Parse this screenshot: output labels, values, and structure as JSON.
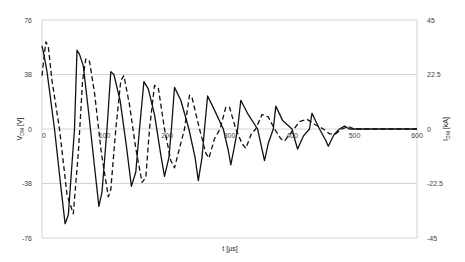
{
  "chart_data": {
    "type": "line",
    "title": "",
    "xlabel": "t [µs]",
    "ylabel": "V_DM [V]",
    "y2label": "I_DM [kA]",
    "xlim": [
      0,
      600
    ],
    "ylim": [
      -76,
      76
    ],
    "y2lim": [
      -45,
      45
    ],
    "grid": "horizontal",
    "legend": "none",
    "x_ticks": [
      "0",
      "100",
      "200",
      "300",
      "400",
      "500",
      "600"
    ],
    "y_ticks": [
      "76",
      "38",
      "0",
      "-38",
      "-76"
    ],
    "y2_ticks": [
      "45",
      "22.5",
      "0",
      "-22.5",
      "-45"
    ],
    "series": [
      {
        "name": "V_DM (solid)",
        "axis": "left",
        "style": "solid",
        "points": [
          [
            0,
            58
          ],
          [
            3,
            52
          ],
          [
            8,
            40
          ],
          [
            20,
            0
          ],
          [
            30,
            -40
          ],
          [
            37,
            -66
          ],
          [
            42,
            -60
          ],
          [
            52,
            0
          ],
          [
            56,
            55
          ],
          [
            60,
            52
          ],
          [
            66,
            44
          ],
          [
            75,
            10
          ],
          [
            85,
            -30
          ],
          [
            91,
            -54
          ],
          [
            96,
            -44
          ],
          [
            104,
            0
          ],
          [
            110,
            40
          ],
          [
            115,
            38
          ],
          [
            125,
            20
          ],
          [
            135,
            -12
          ],
          [
            143,
            -40
          ],
          [
            150,
            -30
          ],
          [
            156,
            0
          ],
          [
            163,
            33
          ],
          [
            170,
            28
          ],
          [
            180,
            10
          ],
          [
            190,
            -18
          ],
          [
            196,
            -33
          ],
          [
            203,
            -20
          ],
          [
            207,
            0
          ],
          [
            212,
            29
          ],
          [
            222,
            20
          ],
          [
            235,
            0
          ],
          [
            245,
            -20
          ],
          [
            250,
            -36
          ],
          [
            256,
            -20
          ],
          [
            260,
            0
          ],
          [
            265,
            23
          ],
          [
            275,
            14
          ],
          [
            290,
            0
          ],
          [
            298,
            -15
          ],
          [
            302,
            -25
          ],
          [
            308,
            -12
          ],
          [
            313,
            0
          ],
          [
            318,
            20
          ],
          [
            330,
            10
          ],
          [
            345,
            0
          ],
          [
            352,
            -14
          ],
          [
            356,
            -22
          ],
          [
            362,
            -10
          ],
          [
            370,
            0
          ],
          [
            374,
            16
          ],
          [
            385,
            6
          ],
          [
            400,
            0
          ],
          [
            405,
            -8
          ],
          [
            409,
            -14
          ],
          [
            418,
            -5
          ],
          [
            428,
            0
          ],
          [
            432,
            11
          ],
          [
            444,
            0
          ],
          [
            454,
            -8
          ],
          [
            458,
            -12
          ],
          [
            467,
            -4
          ],
          [
            476,
            0
          ],
          [
            484,
            2
          ],
          [
            492,
            0
          ],
          [
            500,
            0
          ],
          [
            600,
            0
          ]
        ]
      },
      {
        "name": "I_DM (dashed)",
        "axis": "right",
        "style": "dashed",
        "points": [
          [
            0,
            22
          ],
          [
            6,
            36
          ],
          [
            10,
            34
          ],
          [
            16,
            20
          ],
          [
            28,
            0
          ],
          [
            40,
            -27
          ],
          [
            50,
            -35
          ],
          [
            58,
            -10
          ],
          [
            65,
            20
          ],
          [
            70,
            29
          ],
          [
            76,
            28
          ],
          [
            84,
            15
          ],
          [
            95,
            -10
          ],
          [
            106,
            -28
          ],
          [
            110,
            -25
          ],
          [
            118,
            0
          ],
          [
            126,
            20
          ],
          [
            131,
            22
          ],
          [
            140,
            10
          ],
          [
            150,
            -8
          ],
          [
            160,
            -22
          ],
          [
            166,
            -20
          ],
          [
            172,
            0
          ],
          [
            180,
            18
          ],
          [
            186,
            17
          ],
          [
            196,
            0
          ],
          [
            206,
            -13
          ],
          [
            212,
            -16
          ],
          [
            220,
            -8
          ],
          [
            228,
            0
          ],
          [
            236,
            14
          ],
          [
            240,
            13
          ],
          [
            252,
            0
          ],
          [
            262,
            -10
          ],
          [
            267,
            -12
          ],
          [
            276,
            -4
          ],
          [
            285,
            0
          ],
          [
            294,
            9
          ],
          [
            300,
            9
          ],
          [
            310,
            0
          ],
          [
            320,
            -6
          ],
          [
            326,
            -8
          ],
          [
            335,
            -2
          ],
          [
            342,
            0
          ],
          [
            352,
            6
          ],
          [
            362,
            5
          ],
          [
            372,
            0
          ],
          [
            382,
            -4
          ],
          [
            388,
            -5
          ],
          [
            400,
            -1
          ],
          [
            412,
            3
          ],
          [
            424,
            4
          ],
          [
            436,
            2
          ],
          [
            450,
            0
          ],
          [
            460,
            -2
          ],
          [
            470,
            -2
          ],
          [
            480,
            0
          ],
          [
            490,
            1
          ],
          [
            500,
            0
          ],
          [
            600,
            0
          ]
        ]
      }
    ]
  },
  "axes": {
    "x_label": "t [µs]",
    "y_left_label": "V",
    "y_left_sub": "DM",
    "y_left_unit": " [V]",
    "y_right_label": "I",
    "y_right_sub": "DM",
    "y_right_unit": " [kA]"
  },
  "colors": {
    "line": "#111111",
    "grid": "#c8c8c8",
    "frame": "#c8c8c8"
  }
}
